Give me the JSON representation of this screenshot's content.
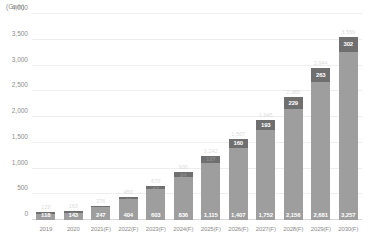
{
  "chart_data": {
    "type": "bar",
    "title": "",
    "subtitle": "",
    "unit_label": "(Gwh)",
    "xlabel": "",
    "ylabel": "",
    "ylim": [
      0,
      4000
    ],
    "yticks": [
      "0",
      "500",
      "1,000",
      "1,500",
      "2,000",
      "2,500",
      "3,000",
      "3,500",
      "4,000"
    ],
    "ytick_values": [
      0,
      500,
      1000,
      1500,
      2000,
      2500,
      3000,
      3500,
      4000
    ],
    "grid": true,
    "legend": "none",
    "stacked": true,
    "categories": [
      "2019",
      "2020",
      "2021(F)",
      "2022(F)",
      "2023(F)",
      "2024(F)",
      "2025(F)",
      "2026(F)",
      "2027(F)",
      "2028(F)",
      "2029(F)",
      "2030(F)"
    ],
    "series": [
      {
        "name": "lower",
        "color": "#9e9e9e",
        "values": [
          118,
          143,
          247,
          404,
          603,
          836,
          1115,
          1407,
          1752,
          2156,
          2681,
          3257
        ],
        "labels": [
          "118",
          "143",
          "247",
          "404",
          "603",
          "836",
          "1,115",
          "1,407",
          "1,752",
          "2,156",
          "2,681",
          "3,257"
        ]
      },
      {
        "name": "upper",
        "color": "#6f6f6f",
        "values": [
          11,
          20,
          29,
          46,
          67,
          94,
          127,
          160,
          193,
          229,
          263,
          302
        ],
        "labels": [
          "11",
          "20",
          "29",
          "46",
          "67",
          "94",
          "127",
          "160",
          "193",
          "229",
          "263",
          "302"
        ]
      }
    ],
    "totals": [
      129,
      163,
      276,
      450,
      670,
      930,
      1242,
      1567,
      1945,
      2385,
      2944,
      3559
    ],
    "total_labels": [
      "129",
      "163",
      "276",
      "450",
      "670",
      "930",
      "1,242",
      "1,567",
      "1,945",
      "2,385",
      "2,944",
      "3,559"
    ]
  }
}
